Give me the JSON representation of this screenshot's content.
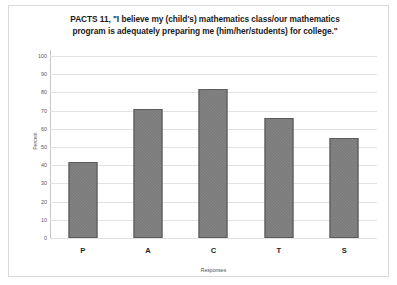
{
  "figure": {
    "title": "PACTS 11, \"I believe my (child's) mathematics class/our mathematics program is adequately preparing me (him/her/students) for college.\""
  },
  "chart_data": {
    "type": "bar",
    "title": "PACTS 11, \"I believe my (child's) mathematics class/our mathematics program is adequately preparing me (him/her/students) for college.\"",
    "categories": [
      "P",
      "A",
      "C",
      "T",
      "S"
    ],
    "values": [
      42,
      71,
      82,
      66,
      55
    ],
    "xlabel": "Responses",
    "ylabel": "Percent",
    "ylim": [
      0,
      100
    ],
    "yticks": [
      0,
      10,
      20,
      30,
      40,
      50,
      60,
      70,
      80,
      90,
      100
    ],
    "ytick_labels": [
      "0",
      "10",
      "20",
      "30",
      "40",
      "50",
      "60",
      "70",
      "80",
      "90",
      "100"
    ],
    "grid": true,
    "legend": false,
    "bar_color": "#6f6f6f",
    "bar_edge_color": "#5c5c5c",
    "gridline_color": "#e2e2e2",
    "series": [
      {
        "name": "Percent",
        "values": [
          42,
          71,
          82,
          66,
          55
        ]
      }
    ]
  }
}
